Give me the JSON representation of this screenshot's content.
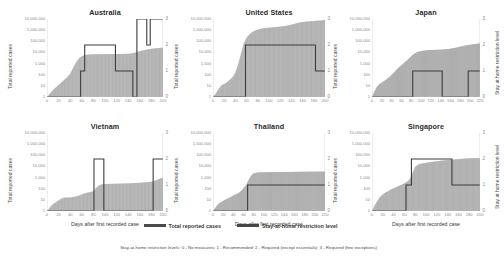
{
  "figure": {
    "legend": {
      "series1_label": "Total reported cases",
      "series2_label": "Stay-at-home restriction level"
    },
    "footnote": "Stay-at-home restriction levels:  0 - No measures;  1 - Recommended;  2 - Required (except essentials);  3 - Required (few exceptions)",
    "axis_titles": {
      "x": "Days after first recorded case",
      "y_left": "Total reported cases",
      "y_right": "Stay at home restriction level"
    },
    "colors": {
      "bars": "#9e9e9e",
      "line": "#3d3d3d",
      "tick_text": "#8a8a8a",
      "title_text": "#2b2b2b"
    }
  },
  "chart_data": [
    {
      "type": "bar",
      "title": "Australia",
      "xlabel": "Days after first recorded case",
      "ylabel": "Total reported cases",
      "y2label": "Stay at home restriction level",
      "ylim": [
        1,
        10000000
      ],
      "yscale": "log",
      "yticks": [
        1,
        10,
        100,
        1000,
        10000,
        100000,
        1000000,
        10000000
      ],
      "yticklabels": [
        "1",
        "10",
        "100",
        "1,000",
        "10,000",
        "100,000",
        "1,000,000",
        "10,000,000"
      ],
      "y2lim": [
        0,
        3
      ],
      "y2ticks": [
        0,
        1,
        2,
        3
      ],
      "xlim": [
        0,
        200
      ],
      "xticks": [
        0,
        20,
        40,
        60,
        80,
        100,
        120,
        140,
        160,
        180,
        200
      ],
      "grid": false,
      "legend_position": "bottom",
      "series": [
        {
          "name": "Total reported cases",
          "kind": "bar",
          "x": [
            0,
            5,
            10,
            15,
            20,
            25,
            30,
            35,
            40,
            45,
            50,
            55,
            60,
            65,
            70,
            75,
            80,
            85,
            90,
            95,
            100,
            105,
            110,
            115,
            120,
            125,
            130,
            135,
            140,
            145,
            150,
            155,
            160,
            165,
            170,
            175,
            180,
            185,
            190,
            195,
            200
          ],
          "values": [
            1,
            2,
            4,
            7,
            12,
            20,
            35,
            60,
            120,
            400,
            1200,
            2800,
            4500,
            5800,
            6300,
            6600,
            6750,
            6850,
            6900,
            6950,
            7000,
            7050,
            7100,
            7150,
            7200,
            7250,
            7300,
            7400,
            7600,
            8000,
            9000,
            11000,
            13000,
            15000,
            17000,
            19000,
            21000,
            22500,
            24000,
            25500,
            27000
          ]
        },
        {
          "name": "Stay at home restriction level",
          "kind": "step",
          "x": [
            0,
            55,
            58,
            65,
            115,
            118,
            145,
            148,
            152,
            155,
            168,
            172,
            178,
            200
          ],
          "values": [
            0,
            0,
            1,
            2,
            2,
            1,
            1,
            0,
            0,
            3,
            3,
            2,
            3,
            3
          ]
        }
      ]
    },
    {
      "type": "bar",
      "title": "United States",
      "xlabel": "Days after first recorded case",
      "ylabel": "Total reported cases",
      "y2label": "Stay at home restriction level",
      "ylim": [
        1,
        10000000
      ],
      "yscale": "log",
      "yticks": [
        1,
        10,
        100,
        1000,
        10000,
        100000,
        1000000,
        10000000
      ],
      "yticklabels": [
        "1",
        "10",
        "100",
        "1,000",
        "10,000",
        "100,000",
        "1,000,000",
        "10,000,000"
      ],
      "y2lim": [
        0,
        3
      ],
      "y2ticks": [
        0,
        1,
        2,
        3
      ],
      "xlim": [
        0,
        200
      ],
      "xticks": [
        0,
        20,
        40,
        60,
        80,
        100,
        120,
        140,
        160,
        180,
        200
      ],
      "grid": false,
      "legend_position": "bottom",
      "series": [
        {
          "name": "Total reported cases",
          "kind": "bar",
          "x": [
            0,
            5,
            10,
            15,
            20,
            25,
            30,
            35,
            40,
            45,
            50,
            55,
            60,
            65,
            70,
            75,
            80,
            85,
            90,
            95,
            100,
            105,
            110,
            115,
            120,
            125,
            130,
            135,
            140,
            145,
            150,
            155,
            160,
            165,
            170,
            175,
            180,
            185,
            190,
            195,
            200
          ],
          "values": [
            1,
            2,
            5,
            11,
            15,
            20,
            35,
            60,
            150,
            900,
            7000,
            60000,
            200000,
            400000,
            650000,
            900000,
            1100000,
            1300000,
            1450000,
            1550000,
            1650000,
            1750000,
            1850000,
            1950000,
            2050000,
            2200000,
            2400000,
            2700000,
            3100000,
            3600000,
            4200000,
            4800000,
            5300000,
            5700000,
            6000000,
            6300000,
            6600000,
            6900000,
            7200000,
            7500000,
            7800000
          ]
        },
        {
          "name": "Stay at home restriction level",
          "kind": "step",
          "x": [
            0,
            55,
            58,
            180,
            183,
            200
          ],
          "values": [
            0,
            0,
            2,
            2,
            1,
            1
          ]
        }
      ]
    },
    {
      "type": "bar",
      "title": "Japan",
      "xlabel": "Days after first recorded case",
      "ylabel": "Total reported cases",
      "y2label": "Stay at home restriction level",
      "ylim": [
        1,
        10000000
      ],
      "yscale": "log",
      "yticks": [
        1,
        10,
        100,
        1000,
        10000,
        100000,
        1000000,
        10000000
      ],
      "yticklabels": [
        "1",
        "10",
        "100",
        "1,000",
        "10,000",
        "100,000",
        "1,000,000",
        "10,000,000"
      ],
      "y2lim": [
        0,
        3
      ],
      "y2ticks": [
        0,
        1,
        2,
        3
      ],
      "xlim": [
        0,
        220
      ],
      "xticks": [
        0,
        20,
        40,
        60,
        80,
        100,
        120,
        140,
        160,
        180,
        200,
        220
      ],
      "grid": false,
      "legend_position": "bottom",
      "series": [
        {
          "name": "Total reported cases",
          "kind": "bar",
          "x": [
            0,
            5,
            10,
            15,
            20,
            25,
            30,
            35,
            40,
            45,
            50,
            55,
            60,
            65,
            70,
            75,
            80,
            85,
            90,
            95,
            100,
            105,
            110,
            115,
            120,
            125,
            130,
            135,
            140,
            145,
            150,
            155,
            160,
            165,
            170,
            175,
            180,
            185,
            190,
            195,
            200,
            205,
            210,
            215,
            220
          ],
          "values": [
            1,
            3,
            8,
            14,
            20,
            28,
            40,
            60,
            95,
            160,
            280,
            450,
            700,
            1100,
            1700,
            2800,
            4500,
            7000,
            9500,
            11500,
            13000,
            14200,
            15200,
            15900,
            16400,
            16800,
            17100,
            17400,
            17800,
            18300,
            19000,
            20000,
            21500,
            23500,
            26000,
            29000,
            33000,
            37000,
            41000,
            45000,
            49000,
            53000,
            57000,
            61000,
            65000
          ]
        },
        {
          "name": "Stay at home restriction level",
          "kind": "step",
          "x": [
            0,
            80,
            83,
            140,
            143,
            193,
            196,
            220
          ],
          "values": [
            0,
            0,
            1,
            1,
            0,
            0,
            1,
            1
          ]
        }
      ]
    },
    {
      "type": "bar",
      "title": "Vietnam",
      "xlabel": "Days after first recorded case",
      "ylabel": "Total reported cases",
      "y2label": "Stay at home restriction level",
      "ylim": [
        1,
        10000000
      ],
      "yscale": "log",
      "yticks": [
        1,
        10,
        100,
        1000,
        10000,
        100000,
        1000000,
        10000000
      ],
      "yticklabels": [
        "1",
        "10",
        "100",
        "1,000",
        "10,000",
        "100,000",
        "1,000,000",
        "10,000,000"
      ],
      "y2lim": [
        0,
        3
      ],
      "y2ticks": [
        0,
        1,
        2,
        3
      ],
      "xlim": [
        0,
        200
      ],
      "xticks": [
        0,
        20,
        40,
        60,
        80,
        100,
        120,
        140,
        160,
        180,
        200
      ],
      "grid": false,
      "legend_position": "bottom",
      "series": [
        {
          "name": "Total reported cases",
          "kind": "bar",
          "x": [
            0,
            5,
            10,
            15,
            20,
            25,
            30,
            35,
            40,
            45,
            50,
            55,
            60,
            65,
            70,
            75,
            80,
            85,
            90,
            95,
            100,
            105,
            110,
            115,
            120,
            125,
            130,
            135,
            140,
            145,
            150,
            155,
            160,
            165,
            170,
            175,
            180,
            185,
            190,
            195,
            200
          ],
          "values": [
            1,
            2,
            4,
            6,
            9,
            13,
            16,
            16,
            16,
            18,
            20,
            24,
            30,
            38,
            45,
            50,
            60,
            120,
            200,
            250,
            268,
            270,
            272,
            275,
            280,
            285,
            290,
            295,
            300,
            310,
            320,
            330,
            340,
            355,
            370,
            390,
            420,
            500,
            620,
            800,
            1000
          ]
        },
        {
          "name": "Stay at home restriction level",
          "kind": "step",
          "x": [
            0,
            78,
            81,
            95,
            98,
            180,
            183,
            200
          ],
          "values": [
            0,
            0,
            2,
            2,
            0,
            0,
            2,
            2
          ]
        }
      ]
    },
    {
      "type": "bar",
      "title": "Thailand",
      "xlabel": "Days after first recorded case",
      "ylabel": "Total reported cases",
      "y2label": "Stay at home restriction level",
      "ylim": [
        1,
        10000000
      ],
      "yscale": "log",
      "yticks": [
        1,
        10,
        100,
        1000,
        10000,
        100000,
        1000000,
        10000000
      ],
      "yticklabels": [
        "1",
        "10",
        "100",
        "1,000",
        "10,000",
        "100,000",
        "1,000,000",
        "10,000,000"
      ],
      "y2lim": [
        0,
        3
      ],
      "y2ticks": [
        0,
        1,
        2,
        3
      ],
      "xlim": [
        0,
        220
      ],
      "xticks": [
        0,
        20,
        40,
        60,
        80,
        100,
        120,
        140,
        160,
        180,
        200,
        220
      ],
      "grid": false,
      "legend_position": "bottom",
      "series": [
        {
          "name": "Total reported cases",
          "kind": "bar",
          "x": [
            0,
            5,
            10,
            15,
            20,
            25,
            30,
            35,
            40,
            45,
            50,
            55,
            60,
            65,
            70,
            75,
            80,
            85,
            90,
            95,
            100,
            105,
            110,
            115,
            120,
            125,
            130,
            135,
            140,
            145,
            150,
            155,
            160,
            165,
            170,
            175,
            180,
            185,
            190,
            195,
            200,
            205,
            210,
            215,
            220
          ],
          "values": [
            1,
            2,
            4,
            6,
            8,
            11,
            14,
            18,
            25,
            32,
            40,
            60,
            110,
            200,
            600,
            1500,
            2400,
            2700,
            2900,
            2980,
            3000,
            3020,
            3040,
            3060,
            3080,
            3100,
            3120,
            3140,
            3160,
            3180,
            3200,
            3220,
            3240,
            3260,
            3280,
            3300,
            3320,
            3340,
            3360,
            3380,
            3400,
            3420,
            3440,
            3460,
            3480
          ]
        },
        {
          "name": "Stay at home restriction level",
          "kind": "step",
          "x": [
            0,
            65,
            68,
            220
          ],
          "values": [
            0,
            0,
            1,
            1
          ]
        }
      ]
    },
    {
      "type": "bar",
      "title": "Singapore",
      "xlabel": "Days after first recorded case",
      "ylabel": "Total reported cases",
      "y2label": "Stay at home restriction level",
      "ylim": [
        1,
        10000000
      ],
      "yscale": "log",
      "yticks": [
        1,
        10,
        100,
        1000,
        10000,
        100000,
        1000000,
        10000000
      ],
      "yticklabels": [
        "1",
        "10",
        "100",
        "1,000",
        "10,000",
        "100,000",
        "1,000,000",
        "10,000,000"
      ],
      "y2lim": [
        0,
        3
      ],
      "y2ticks": [
        0,
        1,
        2,
        3
      ],
      "xlim": [
        0,
        200
      ],
      "xticks": [
        0,
        20,
        40,
        60,
        80,
        100,
        120,
        140,
        160,
        180,
        200
      ],
      "grid": false,
      "legend_position": "bottom",
      "series": [
        {
          "name": "Total reported cases",
          "kind": "bar",
          "x": [
            0,
            5,
            10,
            15,
            20,
            25,
            30,
            35,
            40,
            45,
            50,
            55,
            60,
            65,
            70,
            75,
            80,
            85,
            90,
            95,
            100,
            105,
            110,
            115,
            120,
            125,
            130,
            135,
            140,
            145,
            150,
            155,
            160,
            165,
            170,
            175,
            180,
            185,
            190,
            195,
            200
          ],
          "values": [
            1,
            3,
            8,
            18,
            30,
            45,
            60,
            85,
            110,
            140,
            180,
            230,
            300,
            420,
            700,
            2500,
            9000,
            14000,
            17000,
            19000,
            21000,
            23000,
            25000,
            27000,
            29000,
            31000,
            33000,
            35000,
            37000,
            39000,
            41000,
            43000,
            45000,
            47000,
            49000,
            51000,
            52500,
            54000,
            55000,
            56000,
            57000
          ]
        },
        {
          "name": "Stay at home restriction level",
          "kind": "step",
          "x": [
            0,
            60,
            63,
            70,
            73,
            145,
            148,
            200
          ],
          "values": [
            0,
            0,
            1,
            1,
            2,
            2,
            1,
            1
          ]
        }
      ]
    }
  ]
}
